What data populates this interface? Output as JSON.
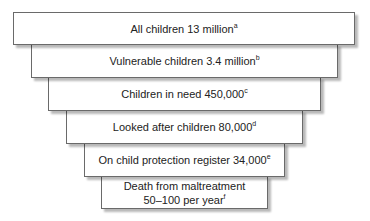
{
  "diagram": {
    "type": "inverted-pyramid",
    "levels": [
      {
        "label": "All children 13 million",
        "note": "a"
      },
      {
        "label": "Vulnerable children 3.4 million",
        "note": "b"
      },
      {
        "label": "Children in need 450,000",
        "note": "c"
      },
      {
        "label": "Looked after children 80,000",
        "note": "d"
      },
      {
        "label": "On child protection register 34,000",
        "note": "e"
      },
      {
        "label": "Death from maltreatment",
        "label2": "50–100 per year",
        "note": "f"
      }
    ]
  }
}
